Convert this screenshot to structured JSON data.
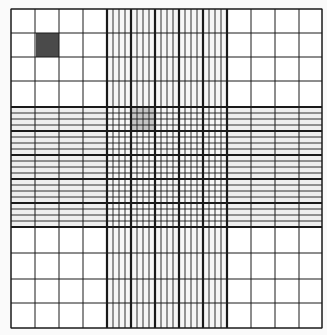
{
  "diagram": {
    "type": "hemocytometer-grid",
    "colors": {
      "background": "#fafafa",
      "grid_fill": "#ffffff",
      "center_band_fill": "#eeeeee",
      "line": "#1a1a1a",
      "dark_square": "#4a4a4a",
      "highlight_square": "#c4c4c4"
    },
    "outer": {
      "x0": 11,
      "y0": 9,
      "x1": 322,
      "y1": 328,
      "v_lines": [
        11,
        35,
        59,
        83,
        107,
        227,
        251,
        275,
        299,
        322
      ],
      "h_lines": [
        9,
        33,
        57,
        81,
        107,
        227,
        253,
        279,
        303,
        328
      ]
    },
    "center": {
      "x0": 107,
      "x1": 227,
      "y0": 107,
      "y1": 227,
      "thick_v": [
        107,
        131,
        155,
        179,
        203,
        227
      ],
      "thick_h": [
        107,
        131,
        155,
        179,
        203,
        227
      ],
      "subdivisions": 4
    },
    "highlights": [
      {
        "name": "dark-corner-square",
        "x": 36,
        "y": 33,
        "w": 23,
        "h": 24,
        "color_key": "dark_square"
      },
      {
        "name": "center-highlight-square",
        "x": 131,
        "y": 107,
        "w": 24,
        "h": 24,
        "color_key": "highlight_square"
      }
    ]
  }
}
